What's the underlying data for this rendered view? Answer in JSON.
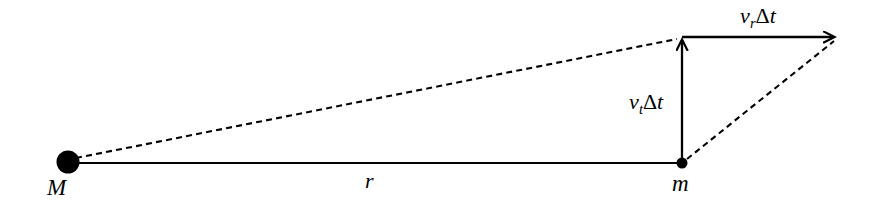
{
  "figure": {
    "domain": "diagram",
    "type": "orbital-mechanics-vector-decomposition",
    "background_color": "#ffffff",
    "stroke_color": "#000000",
    "width": 874,
    "height": 208
  },
  "labels": {
    "central_mass": "M",
    "orbiting_mass": "m",
    "separation": "r",
    "tangential_displacement_var": "v",
    "tangential_displacement_sub": "t",
    "tangential_displacement_delta": "Δ",
    "tangential_displacement_time": "t",
    "radial_displacement_var": "v",
    "radial_displacement_sub": "r",
    "radial_displacement_delta": "Δ",
    "radial_displacement_time": "t",
    "tangential_displacement_full": "v_t Δt",
    "radial_displacement_full": "v_r Δt"
  },
  "geometry": {
    "central_mass_dot": {
      "cx": 68,
      "cy": 162,
      "r": 11.5
    },
    "orbiting_mass_dot": {
      "cx": 682,
      "cy": 163,
      "r": 5.5
    },
    "separation_line": {
      "x1": 68,
      "y1": 163,
      "x2": 682,
      "y2": 163
    },
    "tangential_arrow": {
      "x1": 682,
      "y1": 163,
      "x2": 682,
      "y2": 37
    },
    "radial_arrow": {
      "x1": 682,
      "y1": 37,
      "x2": 838,
      "y2": 37
    },
    "dashed_new_radius": {
      "x1": 74,
      "y1": 159,
      "x2": 676,
      "y2": 39
    },
    "dashed_hypotenuse": {
      "x1": 686,
      "y1": 160,
      "x2": 834,
      "y2": 41
    },
    "dash_pattern": "6 4",
    "line_width": 2.2
  },
  "colors": {
    "ink": "#000000",
    "paper": "#ffffff"
  }
}
